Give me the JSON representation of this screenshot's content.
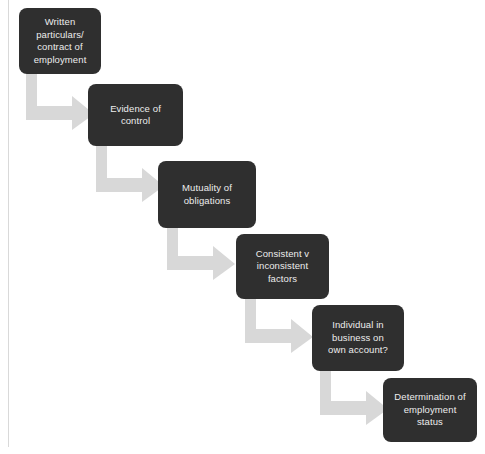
{
  "diagram": {
    "background_color": "#ffffff",
    "node_fill_color": "#2f2f2f",
    "node_text_color": "#ededed",
    "connector_color": "#d8d8d8",
    "rule_color": "#d9d9d9",
    "nodes": [
      {
        "id": "written-particulars",
        "label": "Written\nparticulars/\ncontract of\nemployment",
        "x": 19,
        "y": 8,
        "w": 82,
        "h": 66
      },
      {
        "id": "evidence-of-control",
        "label": "Evidence of\ncontrol",
        "x": 88,
        "y": 84,
        "w": 95,
        "h": 62
      },
      {
        "id": "mutuality-of-obligations",
        "label": "Mutuality of\nobligations",
        "x": 158,
        "y": 161,
        "w": 98,
        "h": 67
      },
      {
        "id": "consistent-v-inconsistent-factors",
        "label": "Consistent v\ninconsistent\nfactors",
        "x": 236,
        "y": 234,
        "w": 93,
        "h": 65
      },
      {
        "id": "individual-in-business-on-own-account",
        "label": "Individual in\nbusiness on\nown account?",
        "x": 312,
        "y": 305,
        "w": 92,
        "h": 66
      },
      {
        "id": "determination-of-employment-status",
        "label": "Determination of\nemployment\nstatus",
        "x": 383,
        "y": 378,
        "w": 94,
        "h": 64
      }
    ],
    "connectors": [
      {
        "id": "arrow-1",
        "from": "written-particulars",
        "to": "evidence-of-control",
        "x": 26,
        "y": 72,
        "w": 68,
        "h": 58
      },
      {
        "id": "arrow-2",
        "from": "evidence-of-control",
        "to": "mutuality-of-obligations",
        "x": 96,
        "y": 144,
        "w": 68,
        "h": 58
      },
      {
        "id": "arrow-3",
        "from": "mutuality-of-obligations",
        "to": "consistent-v-inconsistent-factors",
        "x": 167,
        "y": 226,
        "w": 68,
        "h": 54
      },
      {
        "id": "arrow-4",
        "from": "consistent-v-inconsistent-factors",
        "to": "individual-in-business-on-own-account",
        "x": 245,
        "y": 297,
        "w": 68,
        "h": 56
      },
      {
        "id": "arrow-5",
        "from": "individual-in-business-on-own-account",
        "to": "determination-of-employment-status",
        "x": 320,
        "y": 369,
        "w": 68,
        "h": 56
      }
    ]
  }
}
